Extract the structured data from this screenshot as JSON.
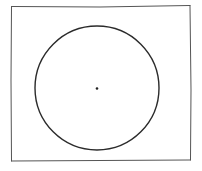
{
  "diagram": {
    "type": "sketch",
    "stroke_color": "#2b2b2b",
    "frame": {
      "x1": 11,
      "y1": 6,
      "x2": 191,
      "y2": 161
    },
    "circle": {
      "cx": 97,
      "cy": 88,
      "r": 62
    },
    "center_point": {
      "cx": 97,
      "cy": 88,
      "r": 1.3
    }
  }
}
